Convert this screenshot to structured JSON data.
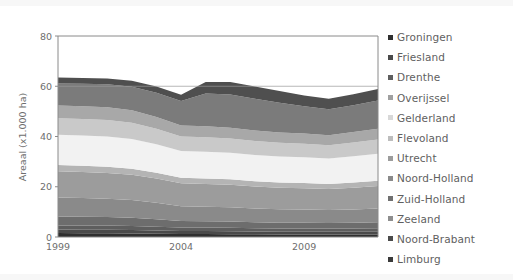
{
  "chart_data": {
    "type": "area",
    "stacked": true,
    "title": "",
    "subtitle": "",
    "xlabel": "",
    "ylabel": "Areaal (x1.000 ha)",
    "xlim": [
      1999,
      2012
    ],
    "ylim": [
      0,
      80
    ],
    "yticks": [
      0,
      20,
      40,
      60,
      80
    ],
    "ytick_labels": [
      "0",
      "20",
      "40",
      "60",
      "80"
    ],
    "xticks": [
      1999,
      2004,
      2009
    ],
    "xtick_labels": [
      "1999",
      "2004",
      "2009"
    ],
    "grid": "horizontal-at-60-only",
    "legend_position": "right",
    "x": [
      1999,
      2000,
      2001,
      2002,
      2003,
      2004,
      2005,
      2006,
      2007,
      2008,
      2009,
      2010,
      2011,
      2012
    ],
    "series": [
      {
        "name": "Groningen",
        "color": "#2f2f2f",
        "values": [
          1.6,
          1.5,
          1.5,
          1.4,
          1.3,
          1.2,
          1.2,
          1.1,
          1.1,
          1.0,
          1.0,
          1.0,
          1.0,
          1.0
        ]
      },
      {
        "name": "Friesland",
        "color": "#4a4a4a",
        "values": [
          1.4,
          1.4,
          1.4,
          1.4,
          1.3,
          1.2,
          1.2,
          1.2,
          1.1,
          1.1,
          1.1,
          1.1,
          1.1,
          1.1
        ]
      },
      {
        "name": "Drenthe",
        "color": "#5e5e5e",
        "values": [
          1.6,
          1.7,
          1.7,
          1.6,
          1.5,
          1.4,
          1.4,
          1.4,
          1.3,
          1.3,
          1.3,
          1.3,
          1.3,
          1.4
        ]
      },
      {
        "name": "Overijssel",
        "color": "#6d6d6d",
        "values": [
          3.6,
          3.5,
          3.4,
          3.3,
          3.0,
          2.6,
          2.5,
          2.5,
          2.4,
          2.3,
          2.3,
          2.2,
          2.3,
          2.4
        ]
      },
      {
        "name": "Gelderland",
        "color": "#8a8a8a",
        "values": [
          7.5,
          7.4,
          7.2,
          7.0,
          6.5,
          5.8,
          5.7,
          5.6,
          5.4,
          5.3,
          5.2,
          5.1,
          5.2,
          5.4
        ]
      },
      {
        "name": "Flevoland",
        "color": "#9c9c9c",
        "values": [
          10.5,
          10.4,
          10.3,
          10.1,
          9.7,
          9.2,
          9.1,
          9.0,
          8.8,
          8.6,
          8.5,
          8.4,
          8.7,
          9.0
        ]
      },
      {
        "name": "Utrecht",
        "color": "#b4b4b4",
        "values": [
          2.5,
          2.5,
          2.5,
          2.4,
          2.3,
          2.2,
          2.2,
          2.2,
          2.1,
          2.1,
          2.1,
          2.0,
          2.1,
          2.1
        ]
      },
      {
        "name": "Noord-Holland",
        "color": "#f2f2f2",
        "values": [
          12.0,
          12.0,
          12.0,
          11.8,
          11.3,
          10.6,
          10.6,
          10.5,
          10.4,
          10.3,
          10.2,
          10.1,
          10.4,
          10.7
        ]
      },
      {
        "name": "Zuid-Holland",
        "color": "#c9c9c9",
        "values": [
          6.6,
          6.6,
          6.6,
          6.5,
          6.2,
          5.8,
          5.8,
          5.7,
          5.6,
          5.5,
          5.4,
          5.3,
          5.5,
          5.7
        ]
      },
      {
        "name": "Zeeland",
        "color": "#a8a8a8",
        "values": [
          5.0,
          5.0,
          5.0,
          4.9,
          4.7,
          4.4,
          4.4,
          4.3,
          4.2,
          4.1,
          4.1,
          4.0,
          4.2,
          4.3
        ]
      },
      {
        "name": "Noord-Brabant",
        "color": "#7b7b7b",
        "values": [
          8.8,
          9.0,
          9.2,
          9.4,
          9.6,
          9.7,
          13.0,
          13.2,
          12.6,
          11.8,
          10.8,
          10.3,
          10.6,
          11.2
        ]
      },
      {
        "name": "Limburg",
        "color": "#4f4f4f",
        "values": [
          2.4,
          2.3,
          2.3,
          2.4,
          2.5,
          2.5,
          4.6,
          5.0,
          4.9,
          4.7,
          4.3,
          4.2,
          4.4,
          4.6
        ]
      }
    ]
  },
  "legend": {
    "items": [
      {
        "label": "Groningen",
        "color": "#2f2f2f"
      },
      {
        "label": "Friesland",
        "color": "#4a4a4a"
      },
      {
        "label": "Drenthe",
        "color": "#5e5e5e"
      },
      {
        "label": "Overijssel",
        "color": "#a0a0a0"
      },
      {
        "label": "Gelderland",
        "color": "#d8d8d8"
      },
      {
        "label": "Flevoland",
        "color": "#bdbdbd"
      },
      {
        "label": "Utrecht",
        "color": "#9c9c9c"
      },
      {
        "label": "Noord-Holland",
        "color": "#8a8a8a"
      },
      {
        "label": "Zuid-Holland",
        "color": "#707070"
      },
      {
        "label": "Zeeland",
        "color": "#8e8e8e"
      },
      {
        "label": "Noord-Brabant",
        "color": "#4a4a4a"
      },
      {
        "label": "Limburg",
        "color": "#3a3a3a"
      }
    ]
  },
  "axes": {
    "y_label": "Areaal (x1.000 ha)",
    "y_ticks": [
      "80",
      "60",
      "40",
      "20",
      "0"
    ],
    "x_ticks": [
      "1999",
      "2004",
      "2009"
    ]
  }
}
